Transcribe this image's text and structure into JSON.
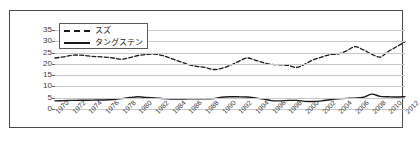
{
  "top_note": "",
  "chart_data": {
    "type": "line",
    "title": "",
    "subtitle": "",
    "xlabel": "",
    "ylabel": "",
    "ylim": [
      0,
      35
    ],
    "yticks": [
      0,
      5,
      10,
      15,
      20,
      25,
      30,
      35
    ],
    "grid": true,
    "legend_position": "top-left",
    "x": [
      1970,
      1971,
      1972,
      1973,
      1974,
      1975,
      1976,
      1977,
      1978,
      1979,
      1980,
      1981,
      1982,
      1983,
      1984,
      1985,
      1986,
      1987,
      1988,
      1989,
      1990,
      1991,
      1992,
      1993,
      1994,
      1995,
      1996,
      1997,
      1998,
      1999,
      2000,
      2001,
      2002,
      2003,
      2004,
      2005,
      2006,
      2007,
      2008,
      2009,
      2010,
      2011,
      2012
    ],
    "xtick_labels": [
      "1970",
      "1972",
      "1974",
      "1976",
      "1978",
      "1980",
      "1982",
      "1984",
      "1986",
      "1988",
      "1990",
      "1992",
      "1994",
      "1996",
      "1998",
      "2000",
      "2002",
      "2004",
      "2006",
      "2008",
      "2010",
      "2012"
    ],
    "series": [
      {
        "name": "スズ",
        "style": "dashed",
        "color": "#1a1a1a",
        "values": [
          22.6,
          23.1,
          23.8,
          23.9,
          23.5,
          23.2,
          23.0,
          22.6,
          22.1,
          22.8,
          23.7,
          24.2,
          24.3,
          23.6,
          22.3,
          21.0,
          19.7,
          18.9,
          18.4,
          17.5,
          18.0,
          19.3,
          21.0,
          22.6,
          21.7,
          20.5,
          19.8,
          19.6,
          19.3,
          18.4,
          19.9,
          21.8,
          23.0,
          24.1,
          24.4,
          25.8,
          27.6,
          26.2,
          24.3,
          23.0,
          25.5,
          27.6,
          29.8
        ]
      },
      {
        "name": "タングステン",
        "style": "solid",
        "color": "#1a1a1a",
        "values": [
          3.6,
          3.7,
          3.8,
          3.9,
          3.9,
          4.0,
          4.0,
          4.2,
          4.6,
          5.1,
          5.4,
          5.1,
          4.9,
          4.6,
          4.4,
          4.4,
          4.5,
          4.5,
          4.5,
          4.6,
          5.2,
          5.4,
          5.4,
          5.3,
          4.9,
          4.4,
          3.7,
          3.6,
          3.8,
          3.8,
          3.4,
          3.3,
          3.6,
          4.1,
          4.5,
          4.7,
          4.8,
          5.2,
          6.6,
          5.6,
          5.4,
          5.3,
          5.5
        ]
      }
    ],
    "series_tail": [
      {
        "name": "スズ",
        "values_2004_2012": [
          24.4,
          25.8,
          27.6,
          30.0,
          29.9,
          30.1,
          29.9,
          30.2,
          27.8,
          23.8,
          24.0,
          24.6,
          24.3,
          23.8
        ]
      },
      {
        "name": "タングステン",
        "values_2004_2012": [
          6.5,
          5.6,
          5.4,
          5.3,
          5.5,
          5.3,
          5.8,
          6.4,
          6.9,
          7.6
        ]
      }
    ]
  }
}
